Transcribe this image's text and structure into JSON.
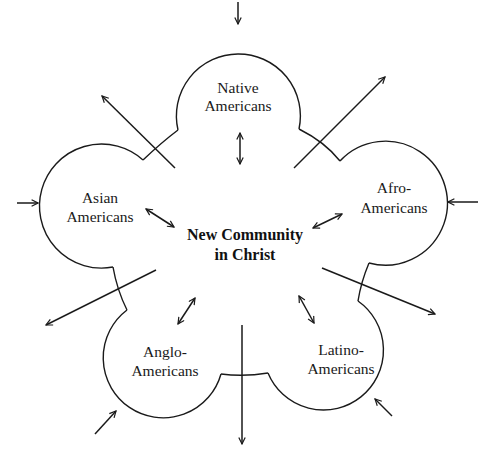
{
  "diagram": {
    "center": {
      "line1": "New Community",
      "line2": "in Christ"
    },
    "groups": [
      {
        "id": "native",
        "line1": "Native",
        "line2": "Americans"
      },
      {
        "id": "asian",
        "line1": "Asian",
        "line2": "Americans"
      },
      {
        "id": "afro",
        "line1": "Afro-",
        "line2": "Americans"
      },
      {
        "id": "anglo",
        "line1": "Anglo-",
        "line2": "Americans"
      },
      {
        "id": "latino",
        "line1": "Latino-",
        "line2": "Americans"
      }
    ],
    "arrows": {
      "inward": [
        "top",
        "left",
        "right",
        "bottom-left",
        "bottom-right"
      ],
      "outward": [
        "upper-left",
        "upper-right",
        "lower-left",
        "lower-right",
        "bottom"
      ],
      "bidirectional": [
        "native-center",
        "asian-center",
        "afro-center",
        "anglo-center",
        "latino-center"
      ]
    },
    "colors": {
      "line": "#1a1a1a",
      "background": "#ffffff"
    }
  }
}
